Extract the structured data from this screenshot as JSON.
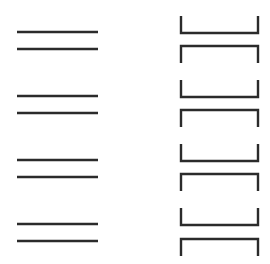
{
  "canvas": {
    "width": 270,
    "height": 264,
    "background_color": "#ffffff",
    "stroke_color": "#2b2b2b"
  },
  "left_column": {
    "name": "flat-bar-column",
    "x_start": 17,
    "x_end": 98,
    "stroke_width": 2.4,
    "item_count": 8,
    "group_count": 4,
    "items": [
      {
        "id": "flat-bar-1",
        "group": 1,
        "y": 32
      },
      {
        "id": "flat-bar-2",
        "group": 1,
        "y": 49
      },
      {
        "id": "flat-bar-3",
        "group": 2,
        "y": 96
      },
      {
        "id": "flat-bar-4",
        "group": 2,
        "y": 113
      },
      {
        "id": "flat-bar-5",
        "group": 3,
        "y": 160
      },
      {
        "id": "flat-bar-6",
        "group": 3,
        "y": 177
      },
      {
        "id": "flat-bar-7",
        "group": 4,
        "y": 224
      },
      {
        "id": "flat-bar-8",
        "group": 4,
        "y": 241
      }
    ]
  },
  "right_column": {
    "name": "channel-profile-column",
    "x_start": 181,
    "x_end": 258,
    "stroke_width": 2.4,
    "flange_depth": 17,
    "item_count": 8,
    "group_count": 4,
    "items": [
      {
        "id": "channel-1",
        "group": 1,
        "orientation": "up",
        "web_y": 33
      },
      {
        "id": "channel-2",
        "group": 1,
        "orientation": "down",
        "web_y": 46
      },
      {
        "id": "channel-3",
        "group": 2,
        "orientation": "up",
        "web_y": 97
      },
      {
        "id": "channel-4",
        "group": 2,
        "orientation": "down",
        "web_y": 110
      },
      {
        "id": "channel-5",
        "group": 3,
        "orientation": "up",
        "web_y": 161
      },
      {
        "id": "channel-6",
        "group": 3,
        "orientation": "down",
        "web_y": 174
      },
      {
        "id": "channel-7",
        "group": 4,
        "orientation": "up",
        "web_y": 225
      },
      {
        "id": "channel-8",
        "group": 4,
        "orientation": "down",
        "web_y": 239
      }
    ]
  }
}
